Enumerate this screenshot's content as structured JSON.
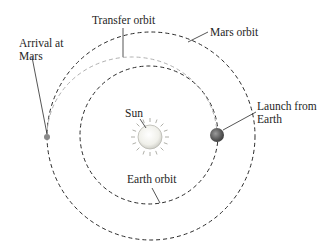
{
  "diagram": {
    "labels": {
      "transfer_orbit": "Transfer orbit",
      "mars_orbit": "Mars orbit",
      "arrival_line1": "Arrival at",
      "arrival_line2": "Mars",
      "launch_line1": "Launch from",
      "launch_line2": "Earth",
      "sun": "Sun",
      "earth_orbit": "Earth orbit"
    },
    "bodies": [
      {
        "name": "Sun",
        "role": "central star"
      },
      {
        "name": "Earth",
        "role": "launch point"
      },
      {
        "name": "Mars",
        "role": "arrival point"
      }
    ],
    "orbits": [
      {
        "name": "Earth orbit",
        "style": "dashed",
        "color": "#2a2a2a"
      },
      {
        "name": "Mars orbit",
        "style": "dashed",
        "color": "#2a2a2a"
      },
      {
        "name": "Transfer orbit",
        "style": "dashed",
        "color": "#b0b0b0"
      }
    ],
    "colors": {
      "orbit_line": "#2a2a2a",
      "transfer_line": "#b0b0b0",
      "sun_fill": "#f4f4f0",
      "earth_fill": "#6d6d6d",
      "mars_fill": "#8a8a8a",
      "text": "#1e1e1e"
    }
  }
}
